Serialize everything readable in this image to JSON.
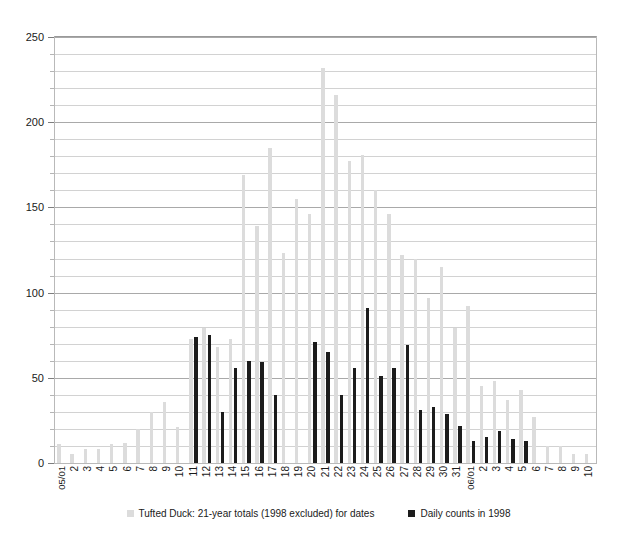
{
  "caption": {
    "clipped_text": "· · · ·                    ·                          ·   ·"
  },
  "legend": {
    "position": "bottom-center",
    "items": [
      {
        "label": "Tufted Duck: 21-year totals (1998 excluded) for dates",
        "color": "#dcdcdc",
        "swatch": "gray"
      },
      {
        "label": "Daily counts in 1998",
        "color": "#1c1c1c",
        "swatch": "black"
      }
    ]
  },
  "axis": {
    "y_ticks": [
      "0",
      "50",
      "100",
      "150",
      "200",
      "250"
    ],
    "y_min": 0,
    "y_max": 250,
    "y_major_step": 50,
    "y_minor_step": 10
  },
  "chart_data": {
    "type": "bar",
    "title": "",
    "subtitle": "",
    "xlabel": "",
    "ylabel": "",
    "ylim": [
      0,
      250
    ],
    "grid": true,
    "legend_position": "bottom",
    "categories": [
      "05/01",
      "2",
      "3",
      "4",
      "5",
      "6",
      "7",
      "8",
      "9",
      "10",
      "11",
      "12",
      "13",
      "14",
      "15",
      "16",
      "17",
      "18",
      "19",
      "20",
      "21",
      "22",
      "23",
      "24",
      "25",
      "26",
      "27",
      "28",
      "29",
      "30",
      "31",
      "06/01",
      "2",
      "3",
      "4",
      "5",
      "6",
      "7",
      "8",
      "9",
      "10"
    ],
    "series": [
      {
        "name": "Tufted Duck: 21-year totals (1998 excluded) for dates",
        "color": "#dcdcdc",
        "values": [
          11,
          5,
          8,
          8,
          11,
          12,
          20,
          30,
          36,
          21,
          73,
          79,
          68,
          73,
          169,
          139,
          185,
          123,
          155,
          146,
          232,
          216,
          177,
          181,
          160,
          146,
          122,
          120,
          97,
          115,
          79,
          92,
          45,
          48,
          37,
          43,
          27,
          10,
          10,
          5,
          5
        ]
      },
      {
        "name": "Daily counts in 1998",
        "color": "#1c1c1c",
        "values": [
          0,
          0,
          0,
          0,
          0,
          0,
          0,
          0,
          0,
          0,
          74,
          75,
          30,
          56,
          60,
          59,
          40,
          0,
          0,
          71,
          65,
          40,
          56,
          91,
          51,
          56,
          69,
          31,
          33,
          29,
          22,
          13,
          15,
          19,
          14,
          13,
          0,
          0,
          0,
          0,
          0
        ]
      }
    ]
  }
}
